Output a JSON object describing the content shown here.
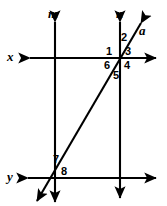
{
  "figure": {
    "kind": "geometry-diagram",
    "width": 167,
    "height": 206,
    "stroke_color": "#000000",
    "background_color": "#ffffff"
  },
  "lines": [
    {
      "id": "m",
      "label": "m",
      "orientation": "vertical",
      "label_x": 48,
      "label_y": 7,
      "x1": 55,
      "y1": 22,
      "x2": 55,
      "y2": 202,
      "arrow_start": true,
      "arrow_end": true
    },
    {
      "id": "n",
      "label": "n",
      "orientation": "vertical",
      "label_x": 116,
      "label_y": 7,
      "x1": 120,
      "y1": 22,
      "x2": 120,
      "y2": 198,
      "arrow_start": true,
      "arrow_end": true
    },
    {
      "id": "x",
      "label": "x",
      "orientation": "horizontal",
      "label_x": 7,
      "label_y": 50,
      "x1": 30,
      "y1": 58,
      "x2": 156,
      "y2": 58,
      "arrow_start": true,
      "arrow_end": true
    },
    {
      "id": "y",
      "label": "y",
      "orientation": "horizontal",
      "label_x": 7,
      "label_y": 170,
      "x1": 28,
      "y1": 178,
      "x2": 156,
      "y2": 178,
      "arrow_start": true,
      "arrow_end": true
    },
    {
      "id": "a",
      "label": "a",
      "orientation": "transversal",
      "label_x": 139,
      "label_y": 24,
      "x1": 141,
      "y1": 23,
      "x2": 37,
      "y2": 201,
      "arrow_start": true,
      "arrow_end": true
    }
  ],
  "intersections": [
    {
      "id": "x-n-a",
      "x": 120,
      "y": 58,
      "note": "line x, line n and transversal a meet"
    },
    {
      "id": "y-m-a",
      "x": 55,
      "y": 178,
      "note": "line y, line m and transversal a meet"
    },
    {
      "id": "x-m",
      "x": 55,
      "y": 58,
      "note": "line x crosses line m"
    },
    {
      "id": "y-n",
      "x": 120,
      "y": 178,
      "note": "line y crosses line n"
    }
  ],
  "angle_labels": [
    {
      "id": "angle-1",
      "text": "1",
      "x": 106,
      "y": 46
    },
    {
      "id": "angle-2",
      "text": "2",
      "x": 121,
      "y": 32
    },
    {
      "id": "angle-3",
      "text": "3",
      "x": 125,
      "y": 46
    },
    {
      "id": "angle-4",
      "text": "4",
      "x": 124,
      "y": 60
    },
    {
      "id": "angle-5",
      "text": "5",
      "x": 113,
      "y": 70
    },
    {
      "id": "angle-6",
      "text": "6",
      "x": 104,
      "y": 60
    },
    {
      "id": "angle-7",
      "text": "7",
      "x": 53,
      "y": 154
    },
    {
      "id": "angle-8",
      "text": "8",
      "x": 61,
      "y": 166
    }
  ]
}
